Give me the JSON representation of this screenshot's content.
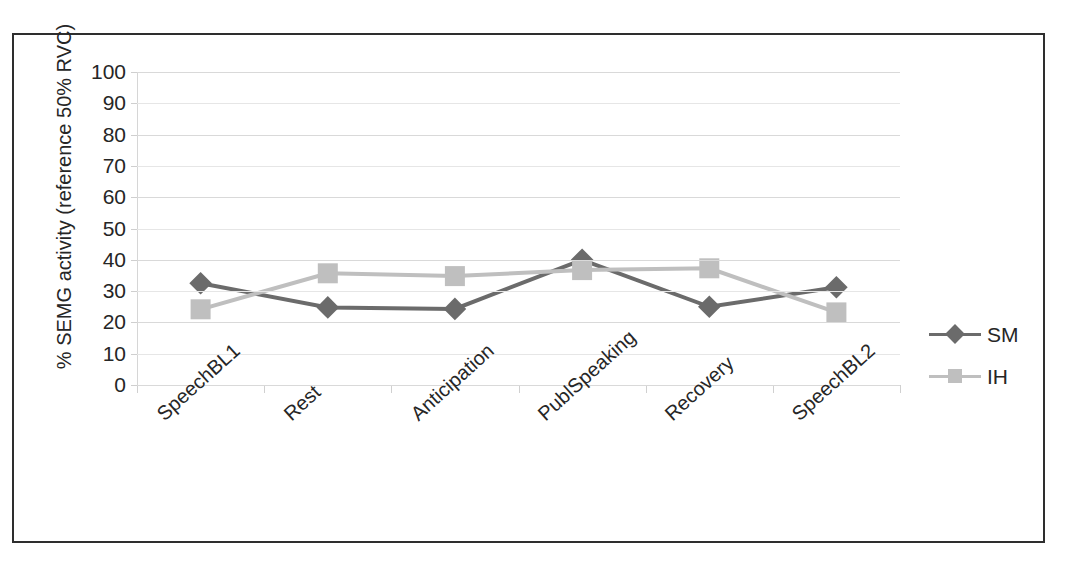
{
  "chart_data": {
    "type": "line",
    "title": "",
    "xlabel": "",
    "ylabel": "% SEMG activity (reference 50% RVC)",
    "ylim": [
      0,
      100
    ],
    "ytick_labels": [
      "100",
      "90",
      "80",
      "70",
      "60",
      "50",
      "40",
      "30",
      "20",
      "10",
      "0"
    ],
    "ytick_values": [
      100,
      90,
      80,
      70,
      60,
      50,
      40,
      30,
      20,
      10,
      0
    ],
    "grid": true,
    "legend_position": "right",
    "categories": [
      "SpeechBL1",
      "Rest",
      "Anticipation",
      "PublSpeaking",
      "Recovery",
      "SpeechBL2"
    ],
    "series": [
      {
        "name": "SM",
        "marker": "diamond",
        "color": "#6b6b6b",
        "values": [
          32.5,
          24.8,
          24.3,
          40.0,
          25.0,
          31.2
        ]
      },
      {
        "name": "IH",
        "marker": "square",
        "color": "#bfbfbf",
        "values": [
          24.2,
          35.7,
          34.8,
          36.7,
          37.3,
          23.2
        ]
      }
    ]
  },
  "legend": {
    "items": [
      {
        "label": "SM",
        "marker": "diamond-marker",
        "color": "#6b6b6b"
      },
      {
        "label": "IH",
        "marker": "square-marker",
        "color": "#bfbfbf"
      }
    ]
  },
  "colors": {
    "frame": "#2e2e2e",
    "gridline": "#d9d9d9",
    "axis": "#cfcfcf",
    "text": "#262626",
    "series_sm": "#6b6b6b",
    "series_ih": "#bfbfbf"
  }
}
